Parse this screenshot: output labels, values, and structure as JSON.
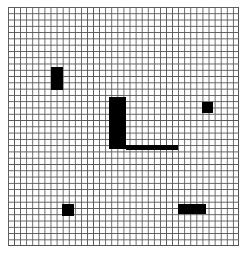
{
  "board": {
    "columns": 38,
    "rows": 38,
    "line_color": "#555555",
    "background": "#ffffff",
    "fill_color": "#000000"
  },
  "blocks": [
    {
      "name": "block-vertical-left",
      "x": 51,
      "y": 67,
      "w": 12,
      "h": 23
    },
    {
      "name": "block-l-vertical",
      "x": 109,
      "y": 97,
      "w": 17,
      "h": 52
    },
    {
      "name": "block-l-horizontal",
      "x": 126,
      "y": 145,
      "w": 52,
      "h": 5
    },
    {
      "name": "block-square-right",
      "x": 202,
      "y": 102,
      "w": 11,
      "h": 11
    },
    {
      "name": "block-square-bottom-left",
      "x": 62,
      "y": 204,
      "w": 12,
      "h": 12
    },
    {
      "name": "block-bar-bottom-right",
      "x": 178,
      "y": 204,
      "w": 28,
      "h": 10
    }
  ]
}
